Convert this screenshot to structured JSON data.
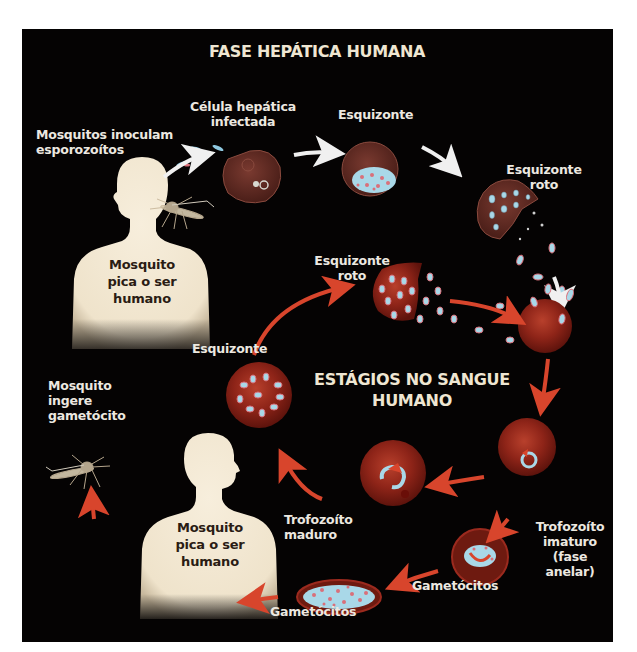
{
  "diagram": {
    "titles": {
      "liver_phase": "FASE HEPÁTICA HUMANA",
      "blood_stages": "ESTÁGIOS NO SANGUE\nHUMANO"
    },
    "labels": {
      "mosquitoes_inoculate": "Mosquitos inoculam\nesporozoítos",
      "infected_liver_cell": "Célula hepática\ninfectada",
      "schizont_liver": "Esquizonte",
      "ruptured_schizont_liver": "Esquizonte\nroto",
      "ruptured_schizont_blood": "Esquizonte\nroto",
      "schizont_blood": "Esquizonte",
      "mosquito_ingests": "Mosquito\ningere\ngametócito",
      "mature_trophozoite": "Trofozoíto\nmaduro",
      "immature_trophozoite": "Trofozoíto\nimaturo\n(fase anelar)",
      "gametocytes_right": "Gametócitos",
      "gametocytes_bottom": "Gametócitos",
      "human_top": "Mosquito\npica o ser\nhumano",
      "human_bottom": "Mosquito\npica o ser\nhumano"
    },
    "colors": {
      "background": "#050303",
      "page": "#ffffff",
      "title_text": "#efe6d2",
      "label_text": "#ece8e0",
      "human_silhouette": "#f3e9d6",
      "red_arrow": "#d8452c",
      "white_arrow": "#f0f0f0",
      "red_blood_cell": "#9b2a1e",
      "liver_cell": "#6a3028",
      "parasite_blue": "#a9d8e8",
      "parasite_pink": "#d9707a"
    }
  }
}
